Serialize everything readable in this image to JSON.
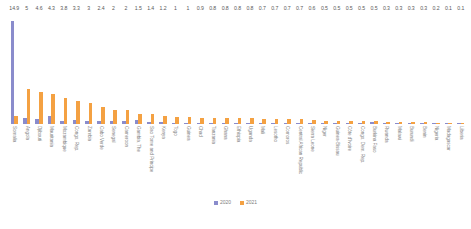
{
  "chart_data": {
    "type": "bar",
    "title": "",
    "subtitle": "",
    "xlabel": "",
    "ylabel": "",
    "ylim": [
      0,
      15
    ],
    "grid": false,
    "legend_position": "bottom",
    "orientation": "vertical",
    "grouping": "grouped",
    "categories": [
      "Somalia",
      "Angola",
      "Djibouti",
      "Mauritania",
      "Mozambique",
      "Congo, Rep.",
      "Zambia",
      "Cabo Verde",
      "Senegal",
      "Cameroon",
      "Gambia, The",
      "Sao Tome and Principe",
      "Kenya",
      "Togo",
      "Guinea",
      "Chad",
      "Tanzania",
      "Ghana",
      "Ethiopia",
      "Uganda",
      "Mali",
      "Lesotho",
      "Comoros",
      "Central African Republic",
      "Sierra Leone",
      "Niger",
      "Guinea-Bissau",
      "Côte d'Ivoire",
      "Congo, Dem. Rep.",
      "Burkina Faso",
      "Rwanda",
      "Malawi",
      "Burundi",
      "Benin",
      "Nigeria",
      "Madagascar",
      "Liberia"
    ],
    "series": [
      {
        "name": "2020",
        "color": "#8a8ccc",
        "values": [
          14.9,
          0.9,
          0.7,
          1.1,
          0.5,
          0.6,
          0.5,
          0.5,
          0.4,
          0.5,
          0.6,
          0.3,
          0.3,
          0.2,
          0.2,
          0.2,
          0.2,
          0.2,
          0.2,
          0.2,
          0.2,
          0.2,
          0.2,
          0.2,
          0.2,
          0.2,
          0.2,
          0.2,
          0.2,
          0.3,
          0.1,
          0.1,
          0.1,
          0.1,
          0.1,
          0.1,
          0.1
        ]
      },
      {
        "name": "2021",
        "color": "#f4a142",
        "values": [
          1.2,
          5,
          4.6,
          4.3,
          3.8,
          3.3,
          3,
          2.4,
          2,
          2,
          1.5,
          1.4,
          1.2,
          1,
          1,
          0.9,
          0.8,
          0.8,
          0.8,
          0.8,
          0.7,
          0.7,
          0.7,
          0.7,
          0.6,
          0.5,
          0.5,
          0.5,
          0.5,
          0.5,
          0.3,
          0.3,
          0.3,
          0.3,
          0.2,
          0.1,
          0.1
        ]
      }
    ],
    "data_labels": [
      "14.9",
      "5",
      "4.6",
      "4.3",
      "3.8",
      "3.3",
      "3",
      "2.4",
      "2",
      "2",
      "1.5",
      "1.4",
      "1.2",
      "1",
      "1",
      "0.9",
      "0.8",
      "0.8",
      "0.8",
      "0.8",
      "0.7",
      "0.7",
      "0.7",
      "0.7",
      "0.6",
      "0.5",
      "0.5",
      "0.5",
      "0.5",
      "0.5",
      "0.3",
      "0.3",
      "0.3",
      "0.3",
      "0.2",
      "0.1",
      "0.1"
    ]
  },
  "legend": {
    "items": [
      {
        "label": "2020",
        "color": "#8a8ccc"
      },
      {
        "label": "2021",
        "color": "#f4a142"
      }
    ]
  }
}
